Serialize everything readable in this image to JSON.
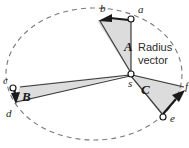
{
  "figure": {
    "background_color": "#ffffff"
  },
  "annotation": {
    "radius_vector_line1": "Radius",
    "radius_vector_line2": "vector"
  },
  "colors": {
    "orbit_stroke": "#7a7a7a",
    "sector_fill": "#dcdcdc",
    "sector_fill_light": "#e2e2e2",
    "line_stroke": "#3a3a3a",
    "arrow_fill": "#1a1a1a",
    "point_fill": "#ffffff",
    "point_stroke": "#1a1a1a",
    "label_color": "#1a1a1a",
    "annotation_color": "#2b2b2b"
  },
  "orbit": {
    "type": "ellipse-dashed",
    "center_x": 94,
    "center_y": 74,
    "radius_x": 88,
    "radius_y": 66,
    "dash_pattern": "5 4"
  },
  "focus": {
    "label": "s",
    "x": 131,
    "y": 74,
    "description": "sun at focus"
  },
  "points": [
    {
      "label": "a",
      "x": 131,
      "y": 19,
      "marker": true
    },
    {
      "label": "b",
      "x": 103,
      "y": 16,
      "marker": false
    },
    {
      "label": "c",
      "x": 13,
      "y": 88,
      "marker": true
    },
    {
      "label": "d",
      "x": 16,
      "y": 104,
      "marker": false
    },
    {
      "label": "e",
      "x": 163,
      "y": 117,
      "marker": true
    },
    {
      "label": "f",
      "x": 185,
      "y": 92,
      "marker": false
    }
  ],
  "sectors": [
    {
      "label": "A",
      "label_x": 124,
      "label_y": 51,
      "from": "a",
      "to": "b"
    },
    {
      "label": "B",
      "label_x": 24,
      "label_y": 97,
      "from": "c",
      "to": "d"
    },
    {
      "label": "C",
      "label_x": 141,
      "label_y": 93,
      "from": "e",
      "to": "f"
    }
  ]
}
